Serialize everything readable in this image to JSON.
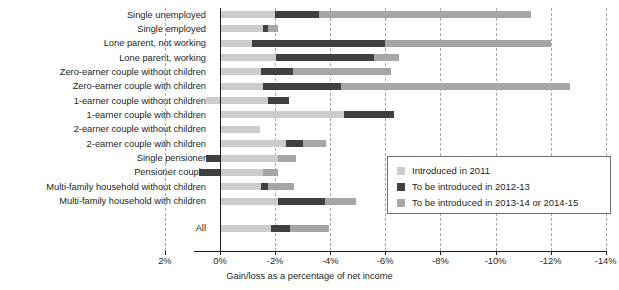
{
  "chart_data": {
    "type": "bar",
    "orientation": "horizontal",
    "stacked": true,
    "title": "",
    "xlabel": "Gain/loss as a percentage of net income",
    "ylabel": "",
    "xlim": [
      2,
      -14
    ],
    "xticks": [
      "2%",
      "0%",
      "-2%",
      "-4%",
      "-6%",
      "-8%",
      "-10%",
      "-12%",
      "-14%"
    ],
    "xtick_values": [
      2,
      0,
      -2,
      -4,
      -6,
      -8,
      -10,
      -12,
      -14
    ],
    "grid": "vertical dashed gridlines at each tick",
    "legend_position": "inside lower right",
    "note": "Each category bar is a stacked set of cumulative ranges. Values are cumulative endpoints in percent of net income (negative = loss).",
    "categories": [
      "Single unemployed",
      "Single employed",
      "Lone parent, not working",
      "Lone parent, working",
      "Zero-earner couple without children",
      "Zero-earner couple with children",
      "1-earner couple without children",
      "1-earner couple with children",
      "2-earner couple without children",
      "2-earner couple with children",
      "Single pensioner",
      "Pensioner couple",
      "Multi-family household without children",
      "Multi-family household with children",
      "All"
    ],
    "series": [
      {
        "name": "Introduced in 2011",
        "color": "#cccccc",
        "segments": [
          {
            "start": 0,
            "end": -2.0
          },
          {
            "start": 0,
            "end": -1.55
          },
          {
            "start": 0,
            "end": -1.15
          },
          {
            "start": 0,
            "end": -2.05
          },
          {
            "start": 0,
            "end": -1.5
          },
          {
            "start": 0,
            "end": -1.55
          },
          {
            "start": 0.5,
            "end": -1.75
          },
          {
            "start": 0,
            "end": -4.5
          },
          {
            "start": 0,
            "end": -1.45
          },
          {
            "start": 0,
            "end": -2.4
          },
          {
            "start": 0,
            "end": -2.1
          },
          {
            "start": 0,
            "end": -1.55
          },
          {
            "start": 0,
            "end": -1.5
          },
          {
            "start": 0,
            "end": -2.1
          },
          {
            "start": 0,
            "end": -1.85
          }
        ]
      },
      {
        "name": "To be introduced in 2012-13",
        "color": "#404040",
        "segments": [
          {
            "start": -2.0,
            "end": -3.6
          },
          {
            "start": -1.55,
            "end": -1.75
          },
          {
            "start": -1.15,
            "end": -6.0
          },
          {
            "start": -2.05,
            "end": -5.6
          },
          {
            "start": -1.5,
            "end": -2.65
          },
          {
            "start": -1.55,
            "end": -4.4
          },
          {
            "start": -1.75,
            "end": -2.5
          },
          {
            "start": -4.5,
            "end": -6.3
          },
          {
            "start": 0,
            "end": 0
          },
          {
            "start": -2.4,
            "end": -3.0
          },
          {
            "start": 0.5,
            "end": 0
          },
          {
            "start": 0.75,
            "end": 0
          },
          {
            "start": -1.5,
            "end": -1.75
          },
          {
            "start": -2.1,
            "end": -3.8
          },
          {
            "start": -1.85,
            "end": -2.55
          }
        ]
      },
      {
        "name": "To be introduced in 2013-14 or 2014-15",
        "color": "#a6a6a6",
        "segments": [
          {
            "start": -3.6,
            "end": -11.3
          },
          {
            "start": -1.75,
            "end": -2.1
          },
          {
            "start": -6.0,
            "end": -12.0
          },
          {
            "start": -5.6,
            "end": -6.5
          },
          {
            "start": -2.65,
            "end": -6.2
          },
          {
            "start": -4.4,
            "end": -12.7
          },
          {
            "start": 0,
            "end": 0
          },
          {
            "start": 0,
            "end": 0
          },
          {
            "start": 0,
            "end": 0
          },
          {
            "start": -3.0,
            "end": -3.85
          },
          {
            "start": -2.1,
            "end": -2.75
          },
          {
            "start": -1.55,
            "end": -2.1
          },
          {
            "start": -1.75,
            "end": -2.7
          },
          {
            "start": -3.8,
            "end": -4.95
          },
          {
            "start": -2.55,
            "end": -3.95
          }
        ]
      }
    ]
  },
  "axis": {
    "title": "Gain/loss as a percentage of net income",
    "ticks": [
      "2%",
      "0%",
      "-2%",
      "-4%",
      "-6%",
      "-8%",
      "-10%",
      "-12%",
      "-14%"
    ]
  },
  "legend": {
    "items": [
      {
        "label": "Introduced in 2011",
        "color": "#cccccc"
      },
      {
        "label": "To be introduced in 2012-13",
        "color": "#404040"
      },
      {
        "label": "To be introduced in 2013-14 or 2014-15",
        "color": "#a6a6a6"
      }
    ]
  }
}
